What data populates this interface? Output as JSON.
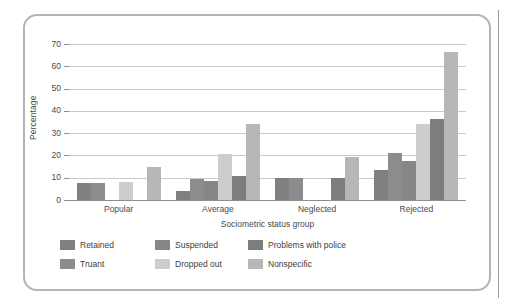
{
  "chart_data": {
    "type": "bar",
    "title": "",
    "subtitle": "",
    "xlabel": "Sociometric status group",
    "ylabel": "Percentage",
    "categories": [
      "Popular",
      "Average",
      "Neglected",
      "Rejected"
    ],
    "ylim": [
      0,
      70
    ],
    "yticks": [
      0,
      10,
      20,
      30,
      40,
      50,
      60,
      70
    ],
    "ytick_labels": [
      "0",
      "10",
      "20",
      "30",
      "40",
      "50",
      "60",
      "70"
    ],
    "grid": "horizontal",
    "legend_position": "bottom",
    "series": [
      {
        "name": "Retained",
        "color": "#808080",
        "values": [
          7.5,
          4.0,
          10.0,
          13.5
        ]
      },
      {
        "name": "Truant",
        "color": "#8c8c8c",
        "values": [
          7.5,
          9.5,
          10.0,
          21.0
        ]
      },
      {
        "name": "Suspended",
        "color": "#878787",
        "values": [
          0,
          8.5,
          0,
          17.5
        ]
      },
      {
        "name": "Dropped out",
        "color": "#cdcdcd",
        "values": [
          8.0,
          20.5,
          0,
          34.0
        ]
      },
      {
        "name": "Problems with police",
        "color": "#7d7d7d",
        "values": [
          0,
          11.0,
          10.0,
          36.5
        ]
      },
      {
        "name": "Nonspecific",
        "color": "#b7b7b7",
        "values": [
          15.0,
          34.0,
          19.5,
          66.5
        ]
      }
    ]
  },
  "legend": {
    "items": [
      {
        "label": "Retained",
        "color": "#808080"
      },
      {
        "label": "Suspended",
        "color": "#878787"
      },
      {
        "label": "Problems with police",
        "color": "#7d7d7d"
      },
      {
        "label": "Truant",
        "color": "#8c8c8c"
      },
      {
        "label": "Dropped out",
        "color": "#cdcdcd"
      },
      {
        "label": "Nonspecific",
        "color": "#b7b7b7"
      }
    ]
  },
  "colors": {
    "frame": "#b4b4b4",
    "gridline": "#c9c9c9",
    "axis": "#8f8f8f",
    "text": "#4a4a4a",
    "background": "#ffffff"
  }
}
